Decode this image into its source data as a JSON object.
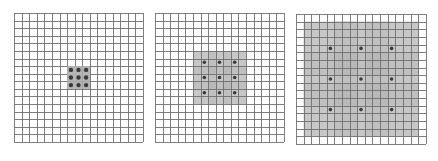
{
  "diagram": {
    "grid_size": 17,
    "colors": {
      "grid_line": "#6f6f6f",
      "background": "#ffffff",
      "dot": "#3a3a3a",
      "shade_light": "#d2d2d2",
      "shade_dark": "#b4b4b4"
    },
    "panels": [
      {
        "id": "panel-1",
        "dilation": 1,
        "receptive_field": 3,
        "x": 14,
        "y": 13,
        "size": 129
      },
      {
        "id": "panel-2",
        "dilation": 2,
        "receptive_field": 7,
        "x": 155,
        "y": 13,
        "size": 129
      },
      {
        "id": "panel-3",
        "dilation": 4,
        "receptive_field": 15,
        "x": 296,
        "y": 14,
        "size": 130
      }
    ]
  }
}
